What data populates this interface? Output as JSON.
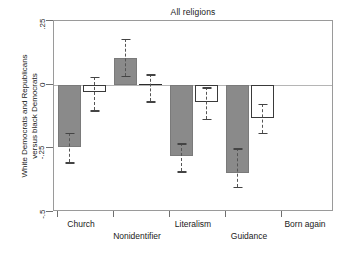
{
  "chart": {
    "title": "All religions",
    "ylabel": "White Democrats and Republicans\nversus black Democrats",
    "ylabel_line1": "White Democrats and Republicans",
    "ylabel_line2": "versus black Democrats"
  },
  "chart_data": {
    "type": "bar",
    "title": "All religions",
    "xlabel": "",
    "ylabel": "White Democrats and Republicans versus black Democrats",
    "ylim": [
      -0.5,
      0.25
    ],
    "yticks": [
      0.25,
      0,
      -0.25,
      -0.5
    ],
    "ytick_labels": [
      ".25",
      "0",
      "-.25",
      "-.5"
    ],
    "grid": false,
    "legend": "none",
    "zero_reference_line": 0,
    "categories": [
      "Church",
      "Nonidentifier",
      "Literalism",
      "Guidance",
      "Born again"
    ],
    "series": [
      {
        "name": "White Democrats",
        "style": "filled-gray",
        "color": "#8a8a8a",
        "values": [
          -0.245,
          0.105,
          -0.28,
          -0.345,
          null
        ],
        "ci_low": [
          -0.305,
          0.035,
          -0.34,
          -0.4,
          null
        ],
        "ci_high": [
          -0.19,
          0.18,
          -0.23,
          -0.25,
          null
        ]
      },
      {
        "name": "White Republicans",
        "style": "hollow-white",
        "color": "#ffffff",
        "values": [
          -0.03,
          0.0,
          -0.07,
          -0.13,
          null
        ],
        "ci_low": [
          -0.1,
          -0.065,
          -0.135,
          -0.19,
          null
        ],
        "ci_high": [
          0.03,
          0.04,
          -0.01,
          -0.075,
          null
        ]
      }
    ]
  },
  "yticks": [
    {
      "label": ".25",
      "value": 0.25
    },
    {
      "label": "0",
      "value": 0
    },
    {
      "label": "-.25",
      "value": -0.25
    },
    {
      "label": "-.5",
      "value": -0.5
    }
  ],
  "xcategories": [
    {
      "label": "Church",
      "row": 0
    },
    {
      "label": "Nonidentifier",
      "row": 1
    },
    {
      "label": "Literalism",
      "row": 0
    },
    {
      "label": "Guidance",
      "row": 1
    },
    {
      "label": "Born again",
      "row": 0
    }
  ]
}
